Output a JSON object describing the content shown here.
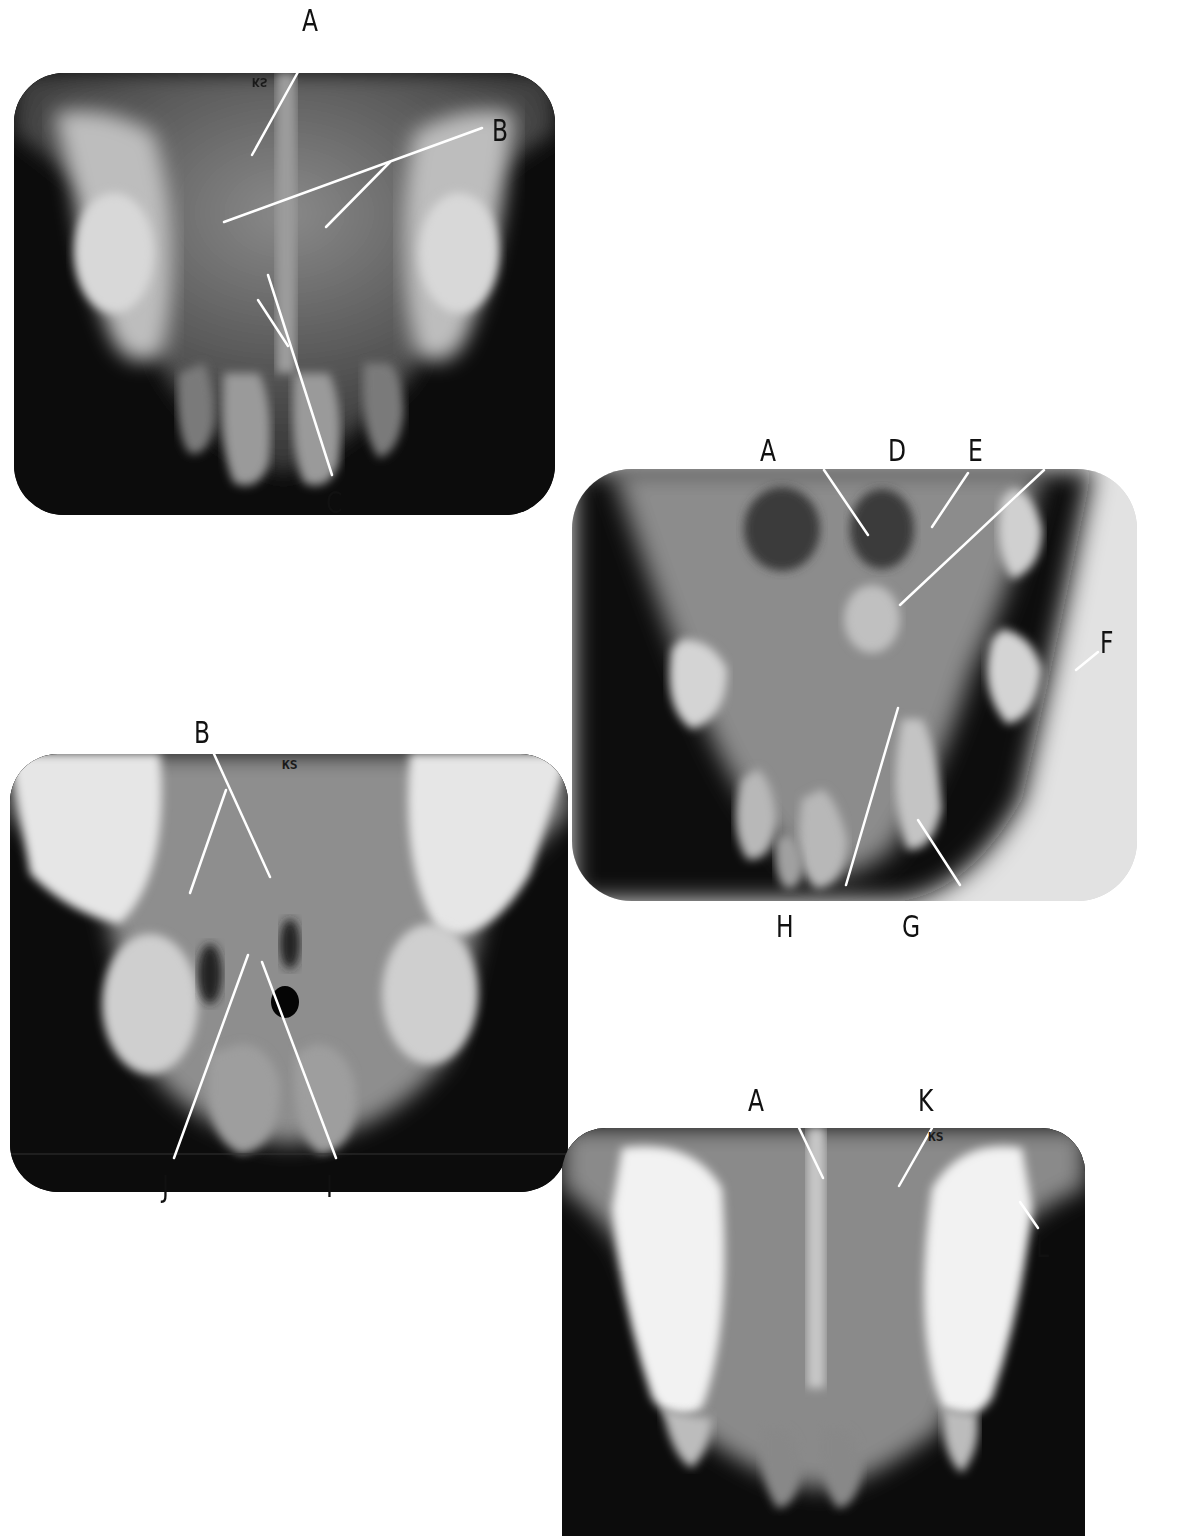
{
  "figure": {
    "panels": [
      {
        "id": "panel-1",
        "marker": "KS",
        "marker_orientation": "mirrored",
        "labels": [
          "A",
          "B",
          "C"
        ]
      },
      {
        "id": "panel-2",
        "labels": [
          "A",
          "D",
          "E",
          "F",
          "H",
          "G"
        ]
      },
      {
        "id": "panel-3",
        "marker": "KS",
        "labels": [
          "B",
          "J",
          "I"
        ]
      },
      {
        "id": "panel-4",
        "marker": "KS",
        "labels": [
          "A",
          "K",
          "L"
        ]
      }
    ]
  },
  "labels": {
    "p1_a": "A",
    "p1_b": "B",
    "p1_c": "C",
    "p2_a": "A",
    "p2_d": "D",
    "p2_e": "E",
    "p2_f": "F",
    "p2_h": "H",
    "p2_g": "G",
    "p3_b": "B",
    "p3_j": "J",
    "p3_i": "I",
    "p4_a": "A",
    "p4_k": "K",
    "p4_l": "L"
  },
  "markers": {
    "p1": "KS",
    "p3": "KS",
    "p4": "KS"
  },
  "colors": {
    "film_dark": "#0c0c0c",
    "tooth_light": "#e8e8e8",
    "leader_line": "#ffffff",
    "label_text": "#111111",
    "page_bg": "#ffffff"
  }
}
